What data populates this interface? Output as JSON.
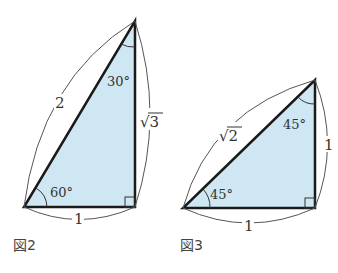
{
  "figures": [
    {
      "caption": "図2",
      "hypotenuse": "2",
      "vertical": "√3",
      "base": "1",
      "angle_bottom": "60°",
      "angle_top": "30°"
    },
    {
      "caption": "図3",
      "hypotenuse": "√2",
      "vertical": "1",
      "base": "1",
      "angle_bottom": "45°",
      "angle_top": "45°"
    }
  ],
  "colors": {
    "fill": "#cfe7f2",
    "stroke": "#1a1a1a",
    "thin": "#444444"
  }
}
